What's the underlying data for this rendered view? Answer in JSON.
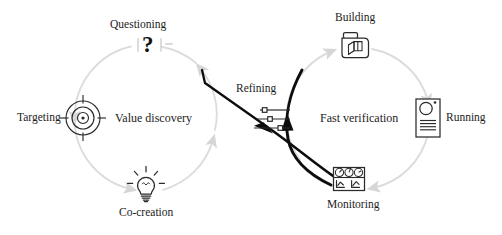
{
  "diagram": {
    "type": "dual-cycle-process",
    "colors": {
      "cycle_arrow": "#d9d9d9",
      "cross_arrow": "#0d0d0d",
      "icon_stroke": "#2b2b2b",
      "text": "#1c1c1c",
      "background": "#ffffff"
    },
    "cycles": [
      {
        "id": "value-discovery",
        "label": "Value discovery",
        "center": {
          "x": 146,
          "y": 118
        },
        "radius": 72,
        "direction": "counter-clockwise",
        "nodes": [
          {
            "id": "targeting",
            "label": "Targeting",
            "icon": "target-icon",
            "position": "left"
          },
          {
            "id": "questioning",
            "label": "Questioning",
            "icon": "question-mark-icon",
            "position": "top"
          },
          {
            "id": "co-creation",
            "label": "Co-creation",
            "icon": "lightbulb-icon",
            "position": "bottom"
          }
        ]
      },
      {
        "id": "fast-verification",
        "label": "Fast verification",
        "center": {
          "x": 357,
          "y": 118
        },
        "radius": 72,
        "direction": "clockwise",
        "nodes": [
          {
            "id": "building",
            "label": "Building",
            "icon": "package-box-icon",
            "position": "top"
          },
          {
            "id": "running",
            "label": "Running",
            "icon": "server-icon",
            "position": "right"
          },
          {
            "id": "monitoring",
            "label": "Monitoring",
            "icon": "dashboard-icon",
            "position": "bottom"
          }
        ]
      }
    ],
    "bridge": {
      "id": "refining",
      "label": "Refining",
      "icon": "sliders-icon",
      "slider_handles": [
        0.35,
        0.5,
        0.72
      ],
      "arrows": [
        {
          "id": "monitoring-to-refining",
          "from": "monitoring",
          "to": "refining",
          "style": "thick-black-curve"
        },
        {
          "id": "refining-to-value-discovery",
          "from": "fast-verification",
          "to": "value-discovery",
          "style": "thick-black-diagonal"
        }
      ]
    }
  },
  "labels": {
    "targeting": "Targeting",
    "questioning": "Questioning",
    "co_creation": "Co-creation",
    "value_discovery": "Value discovery",
    "building": "Building",
    "running": "Running",
    "monitoring": "Monitoring",
    "fast_verification": "Fast verification",
    "refining": "Refining",
    "question_mark": "?"
  }
}
